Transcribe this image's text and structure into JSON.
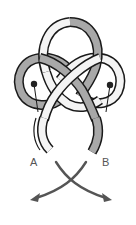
{
  "diagram": {
    "type": "knot-tying-illustration",
    "colors": {
      "outline": "#1a1a1a",
      "strand_a_fill": "#f4f4f4",
      "strand_b_fill": "#a8a8a8",
      "pin": "#222222",
      "arrow": "#555555",
      "background": "#ffffff"
    },
    "strands": [
      {
        "id": "A",
        "fill": "white"
      },
      {
        "id": "B",
        "fill": "gray"
      }
    ],
    "pins": 2,
    "labels": {
      "end_a": "A",
      "end_b": "B"
    },
    "arrows": [
      {
        "from": "A",
        "direction": "down-right"
      },
      {
        "from": "B",
        "direction": "down-left"
      }
    ]
  }
}
